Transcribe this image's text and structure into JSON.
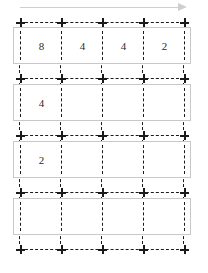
{
  "diagram": {
    "arrow": {
      "name": "direction-arrow",
      "label": ""
    },
    "colors": {
      "grid_line": "#1a1a1a",
      "band_border": "#c8c8c8",
      "arrow": "#cfcfcf",
      "text": "#2b2b2b",
      "background": "#ffffff"
    },
    "columns": 4,
    "rows": 4,
    "grid": {
      "x_positions": [
        20,
        61,
        102,
        143,
        184
      ],
      "y_positions": [
        22,
        78,
        135,
        192,
        249
      ]
    },
    "bands": [
      {
        "name": "row-1",
        "top": 27,
        "height": 37,
        "cells": [
          {
            "value": "8"
          },
          {
            "value": "4"
          },
          {
            "value": "4"
          },
          {
            "value": "2"
          }
        ]
      },
      {
        "name": "row-2",
        "top": 84,
        "height": 37,
        "cells": [
          {
            "value": "4"
          },
          {
            "value": ""
          },
          {
            "value": ""
          },
          {
            "value": ""
          }
        ]
      },
      {
        "name": "row-3",
        "top": 141,
        "height": 37,
        "cells": [
          {
            "value": "2"
          },
          {
            "value": ""
          },
          {
            "value": ""
          },
          {
            "value": ""
          }
        ]
      },
      {
        "name": "row-4",
        "top": 198,
        "height": 37,
        "cells": [
          {
            "value": ""
          },
          {
            "value": ""
          },
          {
            "value": ""
          },
          {
            "value": ""
          }
        ]
      }
    ]
  }
}
